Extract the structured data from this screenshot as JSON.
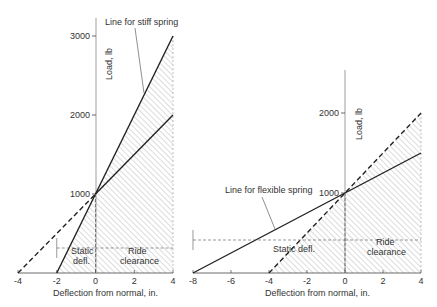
{
  "chart_data": [
    {
      "type": "line",
      "title": "",
      "xlabel": "Deflection from normal, in.",
      "ylabel": "Load, lb",
      "xlim": [
        -4,
        4
      ],
      "ylim": [
        0,
        3000
      ],
      "x_ticks": [
        -4,
        -2,
        0,
        2,
        4
      ],
      "y_ticks": [
        1000,
        2000,
        3000
      ],
      "series": [
        {
          "name": "Line for stiff spring",
          "style": "solid",
          "points": [
            [
              -2,
              0
            ],
            [
              4,
              3000
            ]
          ]
        },
        {
          "name": "Reference line",
          "style": "solid",
          "points": [
            [
              0,
              1000
            ],
            [
              4,
              2000
            ]
          ]
        },
        {
          "name": "Reference line (extension)",
          "style": "dashed",
          "points": [
            [
              -4,
              0
            ],
            [
              0,
              1000
            ]
          ]
        }
      ],
      "annotations": [
        "Line for stiff spring",
        "Static defl.",
        "Ride clearance"
      ]
    },
    {
      "type": "line",
      "title": "",
      "xlabel": "Deflection from normal, in.",
      "ylabel": "Load, lb",
      "xlim": [
        -8,
        4
      ],
      "ylim": [
        0,
        2000
      ],
      "x_ticks": [
        -8,
        -6,
        -4,
        -2,
        0,
        2,
        4
      ],
      "y_ticks": [
        1000,
        2000
      ],
      "series": [
        {
          "name": "Line for flexible spring",
          "style": "solid",
          "points": [
            [
              -8,
              0
            ],
            [
              4,
              1500
            ]
          ]
        },
        {
          "name": "Reference line",
          "style": "dashed",
          "points": [
            [
              -4,
              0
            ],
            [
              4,
              2000
            ]
          ]
        }
      ],
      "annotations": [
        "Line for flexible spring",
        "Static defl.",
        "Ride clearance"
      ]
    }
  ],
  "labels": {
    "stiff": "Line for stiff spring",
    "flexible": "Line for flexible spring",
    "static": "Static defl.",
    "static_line1": "Static",
    "static_line2": "defl.",
    "ride_line1": "Ride",
    "ride_line2": "clearance",
    "xlabel": "Deflection from normal, in.",
    "ylabel": "Load, lb"
  }
}
